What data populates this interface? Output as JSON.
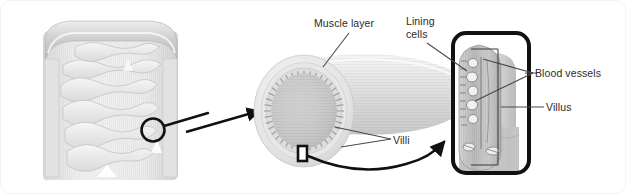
{
  "figure": {
    "background_color": "#ffffff",
    "border_color": "#f4f4f4",
    "line_color": "#1a1a1a",
    "text_color": "#2b2b2b"
  },
  "labels": {
    "muscle_layer": "Muscle layer",
    "lining_cells_line1": "Lining",
    "lining_cells_line2": "cells",
    "blood_vessels": "Blood vessels",
    "villus": "Villus",
    "villi": "Villi"
  },
  "panels": {
    "left": {
      "name": "intestines-anatomy-illustration",
      "description": "Grayscale anatomical drawing of the large and small intestine",
      "callout_shape": "circle"
    },
    "middle": {
      "name": "intestine-tube-cutaway",
      "description": "Grayscale cutaway of an intestinal tube showing the muscle layer, lining cells and villi on the inner surface",
      "marker_shape": "rectangle"
    },
    "right": {
      "name": "villus-detail-box",
      "description": "Boxed grayscale close-up of a single villus showing blood vessels inside",
      "border_radius": 14,
      "border_width": 4
    }
  },
  "connectors": {
    "circle_to_tube": "straight-arrow",
    "marker_to_box": "curved-arrow",
    "muscle_layer_leader": "line",
    "lining_cells_leader": "line",
    "villi_leader": "double-line",
    "blood_vessels_leader": "double-line",
    "villus_leader": "line"
  }
}
